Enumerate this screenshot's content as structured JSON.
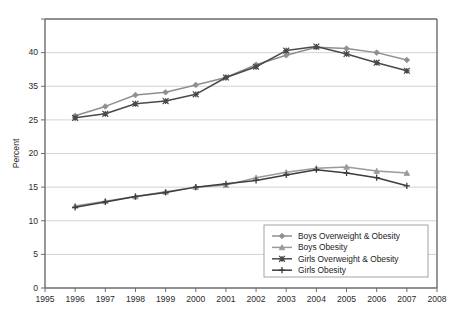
{
  "chart_data": {
    "type": "line",
    "title": "",
    "subtitle": "",
    "xlabel": "",
    "ylabel": "Percent",
    "xlim": [
      1995,
      2008
    ],
    "ylim": [
      0,
      40
    ],
    "grid": true,
    "legend_position": "bottom-right",
    "x_tick_labels": [
      "1995",
      "1996",
      "1997",
      "1998",
      "1999",
      "2000",
      "2001",
      "2002",
      "2003",
      "2004",
      "2005",
      "2006",
      "2007",
      "2008"
    ],
    "y_tick_labels": [
      "0",
      "5",
      "10",
      "15",
      "20",
      "25",
      "35",
      "40"
    ],
    "y_tick_values": [
      0,
      5,
      10,
      15,
      20,
      25,
      30,
      35,
      40
    ],
    "y_tick_label_note": "The 30 gridline is labelled 25 in the source figure",
    "x": [
      1996,
      1997,
      1998,
      1999,
      2000,
      2001,
      2002,
      2003,
      2004,
      2005,
      2006,
      2007
    ],
    "series": [
      {
        "name": "Boys Overweight & Obesity",
        "color": "#8f8f8f",
        "marker": "diamond",
        "values": [
          25.6,
          27.0,
          28.7,
          29.1,
          30.2,
          31.3,
          33.2,
          34.6,
          35.8,
          35.6,
          35.0,
          33.9
        ]
      },
      {
        "name": "Boys Obesity",
        "color": "#9a9a9a",
        "marker": "triangle",
        "values": [
          12.2,
          12.9,
          13.6,
          14.3,
          15.0,
          15.3,
          16.4,
          17.2,
          17.8,
          18.0,
          17.4,
          17.1
        ]
      },
      {
        "name": "Girls Overweight & Obesity",
        "color": "#4a4a4a",
        "marker": "cross",
        "values": [
          25.3,
          25.9,
          27.4,
          27.8,
          28.8,
          31.3,
          32.9,
          35.3,
          35.9,
          34.8,
          33.5,
          32.3
        ]
      },
      {
        "name": "Girls Obesity",
        "color": "#3d3d3d",
        "marker": "plus",
        "values": [
          12.0,
          12.8,
          13.6,
          14.2,
          15.0,
          15.5,
          16.0,
          16.8,
          17.6,
          17.1,
          16.4,
          15.2
        ]
      }
    ]
  },
  "legend": {
    "items": [
      {
        "label": "Boys Overweight & Obesity"
      },
      {
        "label": "Boys Obesity"
      },
      {
        "label": "Girls Overweight & Obesity"
      },
      {
        "label": "Girls Obesity"
      }
    ]
  }
}
